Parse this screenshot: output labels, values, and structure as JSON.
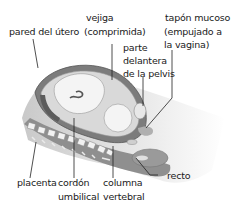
{
  "labels": {
    "uterine_wall": "pared del útero",
    "bladder_line1": "vejiga",
    "bladder_line2": "(comprimida)",
    "pelvis_line1": "parte",
    "pelvis_line2": "delantera",
    "pelvis_line3": "de la pelvis",
    "plug_line1": "tapón mucoso",
    "plug_line2": "(empujado a",
    "plug_line3": "la vagina)",
    "placenta": "placenta",
    "cord_line1": "cordón",
    "cord_line2": "umbilical",
    "spine_line1": "columna",
    "spine_line2": "vertebral",
    "rectum": "recto"
  }
}
